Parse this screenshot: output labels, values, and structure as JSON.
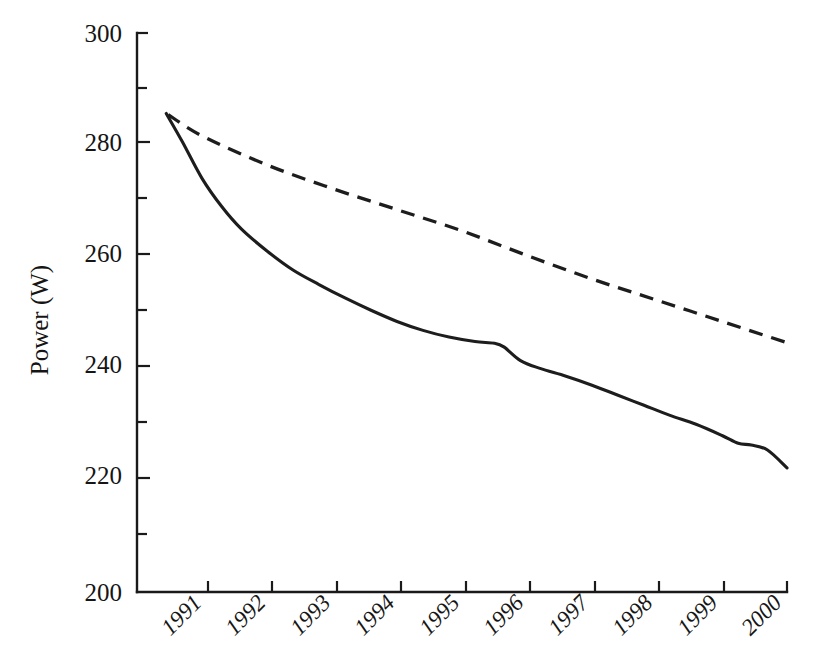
{
  "chart_data": {
    "type": "line",
    "title": "",
    "xlabel": "",
    "ylabel": "Power (W)",
    "xlim": [
      1990.0,
      2000.0
    ],
    "ylim": [
      200,
      300
    ],
    "grid": false,
    "legend": null,
    "y_ticks_major": [
      200,
      220,
      240,
      260,
      280,
      300
    ],
    "y_ticks_minor": [
      210,
      230,
      250,
      270,
      290
    ],
    "y_tick_labels": [
      "200",
      "220",
      "240",
      "260",
      "280",
      "300"
    ],
    "x_ticks": [
      1991,
      1992,
      1993,
      1994,
      1995,
      1996,
      1997,
      1998,
      1999,
      2000
    ],
    "x_tick_labels": [
      "1991",
      "1992",
      "1993",
      "1994",
      "1995",
      "1996",
      "1997",
      "1998",
      "1999",
      "2000"
    ],
    "x_tick_label_rotation": -45,
    "series": [
      {
        "name": "solid-curve",
        "style": "solid",
        "x": [
          1990.45,
          1990.7,
          1991.0,
          1991.3,
          1991.6,
          1992.0,
          1992.4,
          1992.8,
          1993.2,
          1993.6,
          1994.0,
          1994.4,
          1994.8,
          1995.2,
          1995.5,
          1995.65,
          1995.9,
          1996.2,
          1996.6,
          1997.0,
          1997.4,
          1997.8,
          1998.2,
          1998.6,
          1999.0,
          1999.25,
          1999.45,
          1999.7,
          2000.0
        ],
        "y": [
          285.6,
          280.5,
          274.0,
          269.0,
          265.0,
          261.0,
          257.6,
          255.0,
          252.6,
          250.4,
          248.4,
          246.8,
          245.6,
          244.8,
          244.5,
          243.8,
          241.4,
          240.0,
          238.6,
          237.0,
          235.2,
          233.4,
          231.6,
          230.0,
          228.0,
          226.6,
          226.3,
          225.4,
          222.2
        ]
      },
      {
        "name": "dashed-line",
        "style": "dashed",
        "x": [
          1990.48,
          1991.0,
          1992.0,
          1993.0,
          1994.0,
          1995.0,
          1996.0,
          1997.0,
          1998.0,
          1999.0,
          2000.0
        ],
        "y": [
          285.4,
          281.6,
          276.4,
          272.2,
          268.4,
          264.6,
          260.2,
          256.0,
          252.2,
          248.4,
          244.6
        ]
      }
    ],
    "annotations": []
  },
  "axes": {
    "y_axis_title": "Power (W)"
  }
}
